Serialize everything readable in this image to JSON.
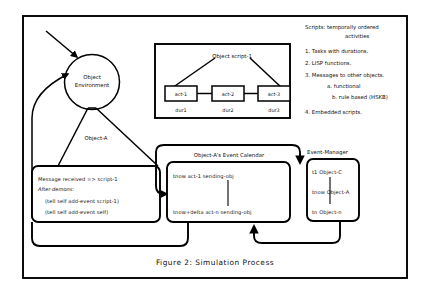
{
  "figure": {
    "caption": "Figure 2: Simulation Process"
  },
  "environment": {
    "circle_label_line1": "Object",
    "circle_label_line2": "Environment",
    "fan_label": "Object-A"
  },
  "script_box": {
    "title": "Object script-1",
    "activities": [
      {
        "name": "act-1",
        "duration": "dur1"
      },
      {
        "name": "act-2",
        "duration": "dur2"
      },
      {
        "name": "act-3",
        "duration": "dur3"
      }
    ]
  },
  "object_a": {
    "line1": "Message received => script-1",
    "line2": "After-demons:",
    "line3": "(tell self add-event script-1)",
    "line4": "(tell self add-event self)"
  },
  "event_calendar": {
    "title": "Object-A's Event Calendar",
    "first_entry": "tnow act-1 sending-obj",
    "last_entry": "tnow+delta act-n sending-obj"
  },
  "event_manager": {
    "title": "Event-Manager",
    "entries": [
      "t1 Object-C",
      "tnow Object-A",
      "tn Object-n"
    ]
  },
  "scripts_legend": {
    "heading_line1": "Scripts: temporally ordered",
    "heading_line2": "activities",
    "items": [
      "1. Tasks with durations.",
      "2. LISP functions.",
      "3. Messages to other objects.",
      "a. functional",
      "b. rule based (HSKB)",
      "4. Embedded scripts."
    ]
  }
}
